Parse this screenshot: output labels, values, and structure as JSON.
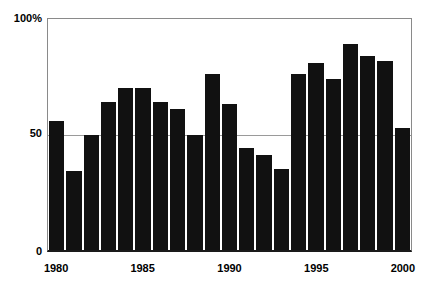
{
  "chart_data": {
    "type": "bar",
    "title": "",
    "subtitle": "",
    "xlabel": "",
    "ylabel": "",
    "ylim": [
      0,
      100
    ],
    "yticks": [
      0,
      50,
      100
    ],
    "ytick_labels": [
      "0",
      "50",
      "100%"
    ],
    "xticks": [
      1980,
      1985,
      1990,
      1995,
      2000
    ],
    "xtick_labels": [
      "1980",
      "1985",
      "1990",
      "1995",
      "2000"
    ],
    "grid": "horizontal-at-50",
    "legend": "none",
    "bar_color": "#111111",
    "categories": [
      "1980",
      "1981",
      "1982",
      "1983",
      "1984",
      "1985",
      "1986",
      "1987",
      "1988",
      "1989",
      "1990",
      "1991",
      "1992",
      "1993",
      "1994",
      "1995",
      "1996",
      "1997",
      "1998",
      "1999",
      "2000"
    ],
    "values": [
      56,
      34,
      50,
      64,
      70,
      70,
      64,
      61,
      50,
      76,
      63,
      44,
      41,
      35,
      76,
      81,
      74,
      89,
      84,
      82,
      53
    ]
  },
  "axes": {
    "y_labels": {
      "top": "100%",
      "middle": "50",
      "bottom": "0"
    },
    "x_labels": [
      {
        "text": "1980",
        "pos_pct": 2.5
      },
      {
        "text": "1985",
        "pos_pct": 26.2
      },
      {
        "text": "1990",
        "pos_pct": 50.0
      },
      {
        "text": "1995",
        "pos_pct": 73.8
      },
      {
        "text": "2000",
        "pos_pct": 97.5
      }
    ]
  }
}
